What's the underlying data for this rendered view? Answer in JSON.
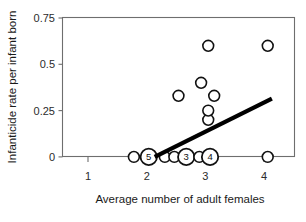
{
  "chart_data": {
    "type": "scatter",
    "title": "",
    "subtitle": "",
    "xlabel": "Average number of adult females",
    "ylabel": "Infanticide rate per infant born",
    "xlim": [
      0.55,
      4.45
    ],
    "ylim": [
      -0.075,
      0.75
    ],
    "xticks": [
      1,
      2,
      3,
      4
    ],
    "xticklabels": [
      "1",
      "2",
      "3",
      "4"
    ],
    "yticks": [
      0,
      0.25,
      0.5,
      0.75
    ],
    "yticklabels": [
      "0",
      "0.25",
      "0.5",
      "0.75"
    ],
    "grid": false,
    "legend": null,
    "marker_style": "open-circle",
    "points": [
      {
        "x": 1.75,
        "y": 0.0,
        "count": 1,
        "label": ""
      },
      {
        "x": 2.0,
        "y": 0.0,
        "count": 5,
        "label": "5"
      },
      {
        "x": 2.27,
        "y": 0.0,
        "count": 1,
        "label": ""
      },
      {
        "x": 2.43,
        "y": 0.0,
        "count": 1,
        "label": ""
      },
      {
        "x": 2.63,
        "y": 0.0,
        "count": 3,
        "label": "3"
      },
      {
        "x": 2.85,
        "y": 0.0,
        "count": 1,
        "label": ""
      },
      {
        "x": 3.03,
        "y": 0.0,
        "count": 4,
        "label": "4"
      },
      {
        "x": 4.0,
        "y": 0.0,
        "count": 1,
        "label": ""
      },
      {
        "x": 3.0,
        "y": 0.2,
        "count": 1,
        "label": ""
      },
      {
        "x": 3.0,
        "y": 0.25,
        "count": 1,
        "label": ""
      },
      {
        "x": 3.1,
        "y": 0.33,
        "count": 1,
        "label": ""
      },
      {
        "x": 2.5,
        "y": 0.33,
        "count": 1,
        "label": ""
      },
      {
        "x": 2.88,
        "y": 0.4,
        "count": 1,
        "label": ""
      },
      {
        "x": 3.0,
        "y": 0.6,
        "count": 1,
        "label": ""
      },
      {
        "x": 4.0,
        "y": 0.6,
        "count": 1,
        "label": ""
      }
    ],
    "trend_line": {
      "x_start": 2.1,
      "y_start": 0.0,
      "x_end": 4.07,
      "y_end": 0.315,
      "color": "#000000"
    },
    "colors": {
      "marker_stroke": "#111111",
      "marker_fill": "#ffffff",
      "axis": "#6e6e6e",
      "trend": "#000000",
      "background": "#ffffff",
      "text": "#1a1a1a"
    }
  }
}
